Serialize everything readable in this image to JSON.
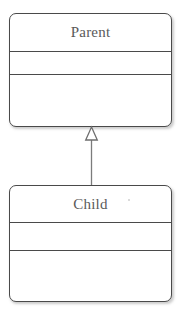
{
  "diagram": {
    "type": "uml-class-diagram",
    "background_color": "#ffffff",
    "border_color": "#4a4a4a",
    "text_color": "#5a5a5a",
    "fill_color": "#ffffff"
  },
  "classes": [
    {
      "id": "parent",
      "name": "Parent",
      "compartments": {
        "attributes": [],
        "operations": []
      }
    },
    {
      "id": "child",
      "name": "Child",
      "compartments": {
        "attributes": [],
        "operations": []
      }
    }
  ],
  "relationships": [
    {
      "id": "generalization-child-parent",
      "kind": "generalization",
      "label": "",
      "source": "Child",
      "target": "Parent",
      "arrowhead": "hollow-triangle",
      "line_style": "solid"
    }
  ]
}
